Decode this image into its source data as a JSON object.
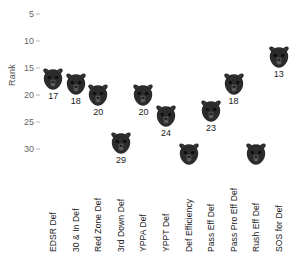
{
  "chart_data": {
    "type": "scatter",
    "title": "",
    "subtitle": "",
    "xlabel": "",
    "ylabel": "Rank",
    "categories": [
      "EDSR Def",
      "30 & In Def",
      "Red Zone Def",
      "3rd Down Def",
      "YPPA Def",
      "YPPT Def",
      "Def Efficiency",
      "Pass Eff Def",
      "Pass Pro Eff Def",
      "Rush Eff Def",
      "SOS for Def"
    ],
    "values": [
      17,
      18,
      20,
      29,
      20,
      24,
      31,
      23,
      18,
      31,
      13
    ],
    "point_labels": [
      "17",
      "18",
      "20",
      "29",
      "20",
      "24",
      "",
      "23",
      "18",
      "",
      "13"
    ],
    "yticks": [
      5,
      10,
      15,
      20,
      25,
      30
    ],
    "ylim": [
      3.5,
      32.5
    ],
    "y_inverted": true,
    "grid": false,
    "legend": "none",
    "marker": "bear-head-logo",
    "marker_color": "#2b2b2b"
  },
  "axis": {
    "y_title": "Rank",
    "tick_labels": [
      "5",
      "10",
      "15",
      "20",
      "25",
      "30"
    ]
  },
  "colors": {
    "background": "#ffffff",
    "marker": "#2b2b2b",
    "tick_text": "#666666",
    "label_text": "#1a1a1a"
  }
}
